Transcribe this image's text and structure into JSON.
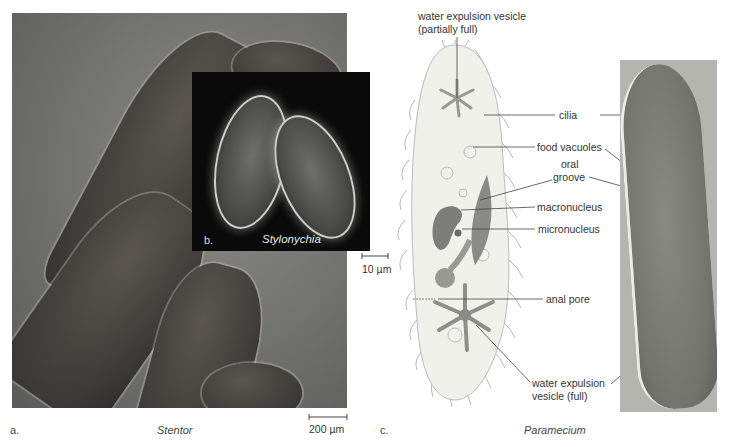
{
  "panels": {
    "a": {
      "letter": "a.",
      "caption": "Stentor",
      "scale_bar": "200 µm"
    },
    "b": {
      "letter": "b.",
      "caption": "Stylonychia",
      "scale_bar": "10 µm"
    },
    "c": {
      "letter": "c.",
      "caption": "Paramecium",
      "labels": {
        "water_expulsion_partial_line1": "water expulsion vesicle",
        "water_expulsion_partial_line2": "(partially full)",
        "cilia": "cilia",
        "food_vacuoles": "food vacuoles",
        "oral_groove_line1": "oral",
        "oral_groove_line2": "groove",
        "macronucleus": "macronucleus",
        "micronucleus": "micronucleus",
        "anal_pore": "anal pore",
        "water_expulsion_full_line1": "water expulsion",
        "water_expulsion_full_line2": "vesicle (full)"
      }
    }
  },
  "colors": {
    "cell_fill": "#f1f1ec",
    "organelle": "#8a8a86",
    "label_text": "#333333",
    "line": "#444444"
  }
}
